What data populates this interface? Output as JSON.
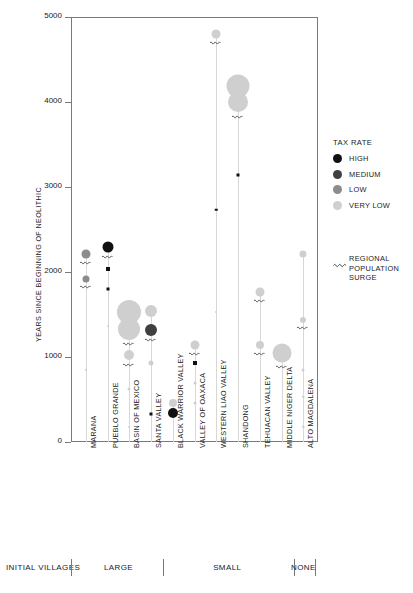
{
  "chart_data": {
    "type": "scatter",
    "title": "",
    "ylabel": "YEARS SINCE BEGINNING OF NEOLITHIC",
    "xlabel": "",
    "ylim": [
      0,
      5000
    ],
    "yticks": [
      0,
      1000,
      2000,
      3000,
      4000,
      5000
    ],
    "ytick_labels": [
      "0",
      "1000",
      "2000",
      "3000",
      "4000",
      "5000"
    ],
    "grid": false,
    "legend_position": "right",
    "size_meaning": "marker area encodes polity scale",
    "categories": [
      "MARANA",
      "PUEBLO GRANDE",
      "BASIN OF MEXICO",
      "SANTA VALLEY",
      "BLACK WARRIOR VALLEY",
      "VALLEY OF OAXACA",
      "WESTERN LIAO VALLEY",
      "SHANDONG",
      "TEHUACAN VALLEY",
      "MIDDLE NIGER DELTA",
      "ALTO MAGDALENA"
    ],
    "series": [
      {
        "name": "MARANA",
        "points": [
          {
            "y": 2210,
            "size": 9,
            "tax": "LOW",
            "surge": true
          },
          {
            "y": 1920,
            "size": 7,
            "tax": "LOW",
            "surge": true
          },
          {
            "y": 850,
            "size": 2.5,
            "tax": "VERY LOW",
            "surge": false
          }
        ]
      },
      {
        "name": "PUEBLO GRANDE",
        "points": [
          {
            "y": 2290,
            "size": 11,
            "tax": "HIGH",
            "surge": true,
            "shape": "circle"
          },
          {
            "y": 2030,
            "size": 4,
            "tax": "HIGH",
            "surge": false,
            "shape": "square"
          },
          {
            "y": 1800,
            "size": 3,
            "tax": "HIGH",
            "surge": false,
            "shape": "square"
          },
          {
            "y": 1370,
            "size": 2,
            "tax": "VERY LOW",
            "surge": false
          }
        ]
      },
      {
        "name": "BASIN OF MEXICO",
        "points": [
          {
            "y": 1530,
            "size": 24,
            "tax": "VERY LOW",
            "surge": false
          },
          {
            "y": 1330,
            "size": 22,
            "tax": "VERY LOW",
            "surge": true
          },
          {
            "y": 1020,
            "size": 10,
            "tax": "VERY LOW",
            "surge": true
          },
          {
            "y": 620,
            "size": 3,
            "tax": "VERY LOW",
            "surge": false
          },
          {
            "y": 180,
            "size": 2,
            "tax": "VERY LOW",
            "surge": false
          }
        ]
      },
      {
        "name": "SANTA VALLEY",
        "points": [
          {
            "y": 1540,
            "size": 12,
            "tax": "VERY LOW",
            "surge": false
          },
          {
            "y": 1320,
            "size": 12,
            "tax": "MEDIUM",
            "surge": true
          },
          {
            "y": 930,
            "size": 5,
            "tax": "VERY LOW",
            "surge": false
          },
          {
            "y": 330,
            "size": 3,
            "tax": "HIGH",
            "surge": false,
            "shape": "square"
          }
        ]
      },
      {
        "name": "BLACK WARRIOR VALLEY",
        "points": [
          {
            "y": 460,
            "size": 8,
            "tax": "VERY LOW",
            "surge": false
          },
          {
            "y": 340,
            "size": 10,
            "tax": "HIGH",
            "surge": false
          }
        ]
      },
      {
        "name": "VALLEY OF OAXACA",
        "points": [
          {
            "y": 1140,
            "size": 9,
            "tax": "VERY LOW",
            "surge": true
          },
          {
            "y": 930,
            "size": 4,
            "tax": "HIGH",
            "surge": false,
            "shape": "square"
          },
          {
            "y": 690,
            "size": 3,
            "tax": "VERY LOW",
            "surge": false
          },
          {
            "y": 460,
            "size": 3,
            "tax": "VERY LOW",
            "surge": false
          }
        ]
      },
      {
        "name": "WESTERN LIAO VALLEY",
        "points": [
          {
            "y": 4800,
            "size": 9,
            "tax": "VERY LOW",
            "surge": true
          },
          {
            "y": 2730,
            "size": 2.5,
            "tax": "HIGH",
            "surge": false,
            "shape": "square"
          },
          {
            "y": 1530,
            "size": 2,
            "tax": "VERY LOW",
            "surge": false
          }
        ]
      },
      {
        "name": "SHANDONG",
        "points": [
          {
            "y": 4190,
            "size": 23,
            "tax": "VERY LOW",
            "surge": false
          },
          {
            "y": 4000,
            "size": 20,
            "tax": "VERY LOW",
            "surge": true
          },
          {
            "y": 3140,
            "size": 3,
            "tax": "HIGH",
            "surge": false,
            "shape": "square"
          }
        ]
      },
      {
        "name": "TEHUACAN VALLEY",
        "points": [
          {
            "y": 1770,
            "size": 9,
            "tax": "VERY LOW",
            "surge": true
          },
          {
            "y": 1140,
            "size": 8,
            "tax": "VERY LOW",
            "surge": true
          }
        ]
      },
      {
        "name": "MIDDLE NIGER DELTA",
        "points": [
          {
            "y": 1050,
            "size": 19,
            "tax": "VERY LOW",
            "surge": true
          }
        ]
      },
      {
        "name": "ALTO MAGDALENA",
        "points": [
          {
            "y": 2210,
            "size": 7,
            "tax": "VERY LOW",
            "surge": false
          },
          {
            "y": 1430,
            "size": 6,
            "tax": "VERY LOW",
            "surge": true
          },
          {
            "y": 850,
            "size": 3,
            "tax": "VERY LOW",
            "surge": false
          },
          {
            "y": 530,
            "size": 2.5,
            "tax": "VERY LOW",
            "surge": false
          },
          {
            "y": 180,
            "size": 2.5,
            "tax": "VERY LOW",
            "surge": false
          }
        ]
      }
    ]
  },
  "legend": {
    "tax_title": "TAX RATE",
    "items": [
      {
        "label": "HIGH",
        "color": "#111111"
      },
      {
        "label": "MEDIUM",
        "color": "#3f3f3f"
      },
      {
        "label": "LOW",
        "color": "#8c8c8c"
      },
      {
        "label": "VERY LOW",
        "color": "#cfcfcf"
      }
    ],
    "surge": {
      "line1": "REGIONAL",
      "line2": "POPULATION",
      "line3": "SURGE"
    }
  },
  "groups": {
    "row_label": "INITIAL VILLAGES",
    "items": [
      {
        "label": "LARGE",
        "from": 0,
        "to": 3
      },
      {
        "label": "SMALL",
        "from": 4,
        "to": 9
      },
      {
        "label": "NONE",
        "from": 10,
        "to": 10
      }
    ]
  },
  "colors": {
    "axis": "#7a7a7a",
    "stem": "#d8d8d8",
    "text": "#1a1a1a"
  }
}
